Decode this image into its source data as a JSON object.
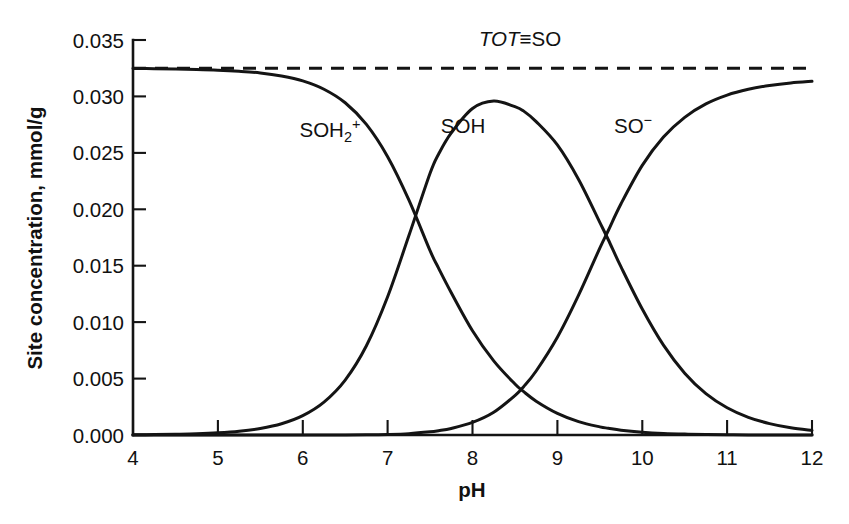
{
  "chart_data": {
    "type": "line",
    "title": "",
    "subtitle": "",
    "xlabel": "pH",
    "ylabel": "Site concentration, mmol/g",
    "xlim": [
      4,
      12
    ],
    "ylim": [
      0.0,
      0.035
    ],
    "xticks": [
      "4",
      "5",
      "6",
      "7",
      "8",
      "9",
      "10",
      "11",
      "12"
    ],
    "xtick_values": [
      4,
      5,
      6,
      7,
      8,
      9,
      10,
      11,
      12
    ],
    "yticks": [
      "0.000",
      "0.005",
      "0.010",
      "0.015",
      "0.020",
      "0.025",
      "0.030",
      "0.035"
    ],
    "ytick_values": [
      0.0,
      0.005,
      0.01,
      0.015,
      0.02,
      0.025,
      0.03,
      0.035
    ],
    "grid": false,
    "legend_position": "inline-annotations",
    "total_site_concentration": 0.0325,
    "pka1": 7.6,
    "pka2": 9.6,
    "x": [
      4.0,
      4.25,
      4.5,
      4.75,
      5.0,
      5.25,
      5.5,
      5.75,
      6.0,
      6.25,
      6.5,
      6.75,
      7.0,
      7.25,
      7.5,
      7.6,
      7.75,
      8.0,
      8.25,
      8.5,
      8.6,
      8.75,
      9.0,
      9.25,
      9.5,
      9.6,
      9.75,
      10.0,
      10.25,
      10.5,
      10.75,
      11.0,
      11.25,
      11.5,
      11.75,
      12.0
    ],
    "series": [
      {
        "name": "SOH2+",
        "label": "SOH₂⁺",
        "style": "solid",
        "color": "#141414",
        "values": [
          0.03248,
          0.03246,
          0.03243,
          0.03239,
          0.03233,
          0.03223,
          0.03208,
          0.03181,
          0.03138,
          0.03064,
          0.02944,
          0.02752,
          0.02466,
          0.02083,
          0.01633,
          0.01479,
          0.01261,
          0.00924,
          0.00657,
          0.00452,
          0.00386,
          0.003,
          0.00192,
          0.00119,
          0.00072,
          0.0006,
          0.00043,
          0.00025,
          0.00014,
          8e-05,
          5e-05,
          3e-05,
          1e-05,
          1e-05,
          0.0,
          0.0
        ]
      },
      {
        "name": "SOH",
        "label": "SOH",
        "style": "solid",
        "color": "#141414",
        "values": [
          2e-05,
          4e-05,
          7e-05,
          0.00011,
          0.00019,
          0.00033,
          0.00058,
          0.001,
          0.00172,
          0.00292,
          0.00487,
          0.00791,
          0.01225,
          0.01765,
          0.02319,
          0.02488,
          0.02677,
          0.02893,
          0.02959,
          0.02909,
          0.02872,
          0.02777,
          0.0257,
          0.02264,
          0.01884,
          0.0173,
          0.01489,
          0.01116,
          0.00796,
          0.00548,
          0.00367,
          0.00242,
          0.00157,
          0.00101,
          0.00064,
          0.00041
        ]
      },
      {
        "name": "SO-",
        "label": "SO⁻",
        "style": "solid",
        "color": "#141414",
        "values": [
          0.0,
          0.0,
          0.0,
          0.0,
          0.0,
          0.0,
          0.0,
          0.0,
          0.0,
          0.0,
          1e-05,
          2e-05,
          5e-05,
          0.00012,
          0.00028,
          0.00038,
          0.00058,
          0.00111,
          0.00201,
          0.00349,
          0.00426,
          0.00567,
          0.00866,
          0.01239,
          0.01656,
          0.01812,
          0.02049,
          0.02389,
          0.0264,
          0.02815,
          0.02934,
          0.03012,
          0.03063,
          0.03097,
          0.0312,
          0.03134
        ]
      },
      {
        "name": "TOT-SO",
        "label": "TOT≡SO",
        "style": "dashed",
        "color": "#141414",
        "constant": 0.0325
      }
    ],
    "annotations": [
      {
        "text": "TOT≡SO",
        "x": 9.05,
        "y": 0.0343,
        "italic_prefix": "TOT",
        "rest": "≡SO"
      },
      {
        "text": "SOH₂⁺",
        "x": 6.73,
        "y": 0.0264
      },
      {
        "text": "SOH",
        "x": 8.25,
        "y": 0.0264
      },
      {
        "text": "SO⁻",
        "x": 10.28,
        "y": 0.0264
      }
    ]
  },
  "axes": {
    "x_title": "pH",
    "y_title": "Site concentration, mmol/g"
  },
  "labels": {
    "tot": {
      "italic": "TOT",
      "rest": "≡SO"
    },
    "soh2": {
      "base": "SOH",
      "sub": "2",
      "sup": "+"
    },
    "soh": {
      "base": "SOH"
    },
    "so_minus": {
      "base": "SO",
      "sup": "−"
    }
  }
}
